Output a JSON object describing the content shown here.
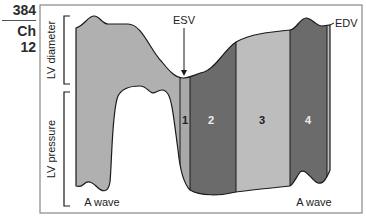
{
  "page": {
    "number": "384",
    "chapter": "Ch 12"
  },
  "figure": {
    "axis_labels": {
      "top": "LV diameter",
      "bottom": "LV pressure"
    },
    "annotations": {
      "esv": "ESV",
      "edv": "EDV",
      "a_wave_left": "A wave",
      "a_wave_right": "A wave"
    },
    "phases": [
      {
        "label": "1",
        "color": "#a9a9a9"
      },
      {
        "label": "2",
        "color": "#6b6b6b"
      },
      {
        "label": "3",
        "color": "#b8b8b8"
      },
      {
        "label": "4",
        "color": "#6b6b6b"
      }
    ],
    "colors": {
      "diastolic_fill": "#b0b0b0",
      "dark_phase": "#6b6b6b",
      "light_phase": "#bdbdbd",
      "outline": "#1a1a1a",
      "frame": "#888888"
    }
  }
}
